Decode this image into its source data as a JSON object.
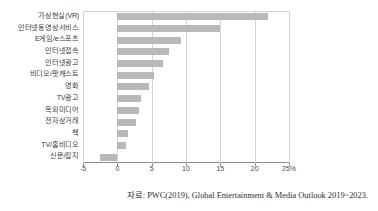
{
  "chart_data": {
    "type": "bar",
    "orientation": "horizontal",
    "title": "",
    "subtitle": "",
    "xlabel": "",
    "ylabel": "",
    "xlim": [
      -5,
      25
    ],
    "xticks": [
      -5,
      0,
      5,
      10,
      15,
      20,
      25
    ],
    "xtick_labels": [
      "-5",
      "0",
      "5",
      "10",
      "15",
      "20",
      "25%"
    ],
    "unit_suffix": "%",
    "grid": true,
    "legend": null,
    "bar_color": "#b9b9b9",
    "categories": [
      "가상현실(VR)",
      "인터넷동영상서비스",
      "E게임/e스포츠",
      "인터넷접속",
      "인터넷광고",
      "비디오/팟캐스트",
      "영화",
      "TV광고",
      "옥외미디어",
      "전자상거래",
      "책",
      "TV/홈비디오",
      "신문/잡지"
    ],
    "values": [
      22.0,
      15.0,
      9.2,
      7.5,
      6.6,
      5.4,
      4.6,
      3.5,
      3.1,
      2.7,
      1.6,
      1.2,
      -2.5
    ],
    "source_note": "자료: PWC(2019), Global Entertainment & Media Outlook 2019~2023."
  }
}
